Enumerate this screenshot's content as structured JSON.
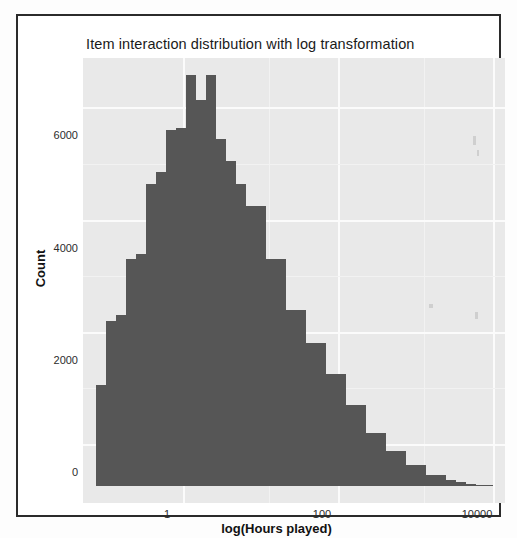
{
  "figure": {
    "title": "Item interaction distribution with log transformation",
    "xlabel": "log(Hours played)",
    "ylabel": "Count",
    "bar_color": "#565656",
    "panel_color": "#e9e9e9",
    "grid_color": "#fbfbfb"
  },
  "chart_data": {
    "type": "bar",
    "title": "Item interaction distribution with log transformation",
    "xlabel": "log(Hours played)",
    "ylabel": "Count",
    "grid": true,
    "legend": null,
    "xscale": "log",
    "xticks": [
      1,
      100,
      10000
    ],
    "xtick_labels": [
      "1",
      "100",
      "10000"
    ],
    "yticks": [
      0,
      2000,
      4000,
      6000
    ],
    "ytick_labels": [
      "0",
      "2000",
      "4000",
      "6000"
    ],
    "ylim": [
      0,
      7600
    ],
    "xlim_log10": [
      -0.62,
      4.6
    ],
    "bin_edges_log10": [
      -0.5,
      -0.37,
      -0.24,
      -0.11,
      0.02,
      0.15,
      0.28,
      0.41,
      0.54,
      0.67,
      0.8,
      0.93,
      1.06,
      1.19,
      1.32,
      1.45,
      1.58,
      1.71,
      1.84,
      1.97,
      2.1,
      2.23,
      2.36,
      2.49,
      2.62,
      2.75,
      2.88,
      3.01,
      3.14,
      3.27,
      3.4,
      3.53,
      3.66,
      3.79,
      3.92,
      4.05,
      4.18,
      4.31,
      4.44,
      4.57
    ],
    "categories": [
      "b1",
      "b2",
      "b3",
      "b4",
      "b5",
      "b6",
      "b7",
      "b8",
      "b9",
      "b10",
      "b11",
      "b12",
      "b13",
      "b14",
      "b15",
      "b16",
      "b17",
      "b18",
      "b19",
      "b20",
      "b21",
      "b22",
      "b23",
      "b24",
      "b25",
      "b26",
      "b27",
      "b28",
      "b29",
      "b30",
      "b31",
      "b32",
      "b33",
      "b34",
      "b35",
      "b36",
      "b37",
      "b38",
      "b39"
    ],
    "values": [
      1800,
      2950,
      3050,
      4050,
      4150,
      5400,
      5600,
      6350,
      6400,
      7350,
      6900,
      7350,
      6200,
      5800,
      5400,
      5000,
      5000,
      4050,
      4050,
      3150,
      3150,
      2550,
      2550,
      2000,
      2000,
      1450,
      1450,
      950,
      950,
      620,
      620,
      380,
      380,
      200,
      200,
      110,
      60,
      30,
      15
    ]
  },
  "bars_px": [
    {
      "x": 13,
      "w": 10,
      "h": 101
    },
    {
      "x": 23,
      "w": 10,
      "h": 165
    },
    {
      "x": 33,
      "w": 10,
      "h": 171
    },
    {
      "x": 43,
      "w": 10,
      "h": 227
    },
    {
      "x": 53,
      "w": 10,
      "h": 232
    },
    {
      "x": 63,
      "w": 10,
      "h": 302
    },
    {
      "x": 73,
      "w": 10,
      "h": 314
    },
    {
      "x": 83,
      "w": 10,
      "h": 356
    },
    {
      "x": 93,
      "w": 10,
      "h": 358
    },
    {
      "x": 103,
      "w": 10,
      "h": 411
    },
    {
      "x": 113,
      "w": 10,
      "h": 386
    },
    {
      "x": 123,
      "w": 10,
      "h": 411
    },
    {
      "x": 133,
      "w": 10,
      "h": 347
    },
    {
      "x": 143,
      "w": 10,
      "h": 325
    },
    {
      "x": 153,
      "w": 10,
      "h": 302
    },
    {
      "x": 163,
      "w": 10,
      "h": 280
    },
    {
      "x": 173,
      "w": 10,
      "h": 280
    },
    {
      "x": 183,
      "w": 10,
      "h": 227
    },
    {
      "x": 193,
      "w": 10,
      "h": 227
    },
    {
      "x": 203,
      "w": 10,
      "h": 176
    },
    {
      "x": 213,
      "w": 10,
      "h": 176
    },
    {
      "x": 223,
      "w": 10,
      "h": 143
    },
    {
      "x": 233,
      "w": 10,
      "h": 143
    },
    {
      "x": 243,
      "w": 10,
      "h": 112
    },
    {
      "x": 253,
      "w": 10,
      "h": 112
    },
    {
      "x": 263,
      "w": 10,
      "h": 81
    },
    {
      "x": 273,
      "w": 10,
      "h": 81
    },
    {
      "x": 283,
      "w": 10,
      "h": 53
    },
    {
      "x": 293,
      "w": 10,
      "h": 53
    },
    {
      "x": 303,
      "w": 10,
      "h": 35
    },
    {
      "x": 313,
      "w": 10,
      "h": 35
    },
    {
      "x": 323,
      "w": 10,
      "h": 21
    },
    {
      "x": 333,
      "w": 10,
      "h": 21
    },
    {
      "x": 343,
      "w": 10,
      "h": 11
    },
    {
      "x": 353,
      "w": 10,
      "h": 11
    },
    {
      "x": 363,
      "w": 10,
      "h": 6
    },
    {
      "x": 373,
      "w": 10,
      "h": 4
    },
    {
      "x": 383,
      "w": 10,
      "h": 2
    },
    {
      "x": 393,
      "w": 17,
      "h": 1
    }
  ],
  "axes_px": {
    "vgrid": [
      {
        "x": 100,
        "major": true
      },
      {
        "x": 186,
        "major": false
      },
      {
        "x": 255,
        "major": true
      },
      {
        "x": 341,
        "major": false
      },
      {
        "x": 410,
        "major": true
      }
    ],
    "hgrid": [
      {
        "y": 428,
        "major": true
      },
      {
        "y": 372,
        "major": false
      },
      {
        "y": 316,
        "major": true
      },
      {
        "y": 260,
        "major": false
      },
      {
        "y": 204,
        "major": true
      },
      {
        "y": 148,
        "major": false
      },
      {
        "y": 91,
        "major": true
      }
    ],
    "xticks": [
      {
        "x": 165,
        "label": "1"
      },
      {
        "x": 320,
        "label": "100"
      },
      {
        "x": 475,
        "label": "10000"
      }
    ],
    "yticks": [
      {
        "y": 470,
        "label": "0"
      },
      {
        "y": 358,
        "label": "2000"
      },
      {
        "y": 246,
        "label": "4000"
      },
      {
        "y": 133,
        "label": "6000"
      }
    ]
  }
}
